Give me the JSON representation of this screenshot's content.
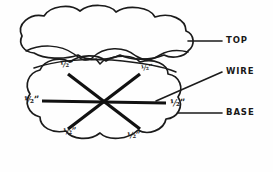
{
  "figure": {
    "background_color": "#fefefe",
    "ink_color": "#1b1b1b",
    "wire_color": "#111111"
  },
  "callouts": [
    {
      "id": "top",
      "label": "TOP",
      "target": "upper cloud shape"
    },
    {
      "id": "wire",
      "label": "WIRE",
      "target": "spoke line inside base"
    },
    {
      "id": "base",
      "label": "BASE",
      "target": "lower cloud shape"
    }
  ],
  "dimensions": {
    "unit": "inch",
    "value_label": "½”",
    "labels": [
      {
        "id": "spoke-upper-left",
        "text": "½”"
      },
      {
        "id": "spoke-upper-right",
        "text": "½”"
      },
      {
        "id": "spoke-left",
        "text": "½”"
      },
      {
        "id": "spoke-right",
        "text": "½”"
      },
      {
        "id": "spoke-lower-left",
        "text": "½”"
      },
      {
        "id": "spoke-lower-right",
        "text": "½”"
      }
    ]
  },
  "shapes": {
    "top_cloud": {
      "name": "top",
      "lobes": 5
    },
    "base_cloud": {
      "name": "base",
      "lobes": 7
    },
    "spokes": {
      "count": 6,
      "arrangement": "radial from center",
      "lines": 3
    }
  }
}
